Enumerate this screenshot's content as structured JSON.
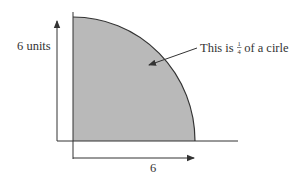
{
  "diagram": {
    "shape": "quarter-circle",
    "colors": {
      "fill": "#b9b9b9",
      "stroke": "#333333",
      "background": "#ffffff"
    },
    "vertical_label": "6 units",
    "horizontal_label": "6",
    "annotation": {
      "prefix": "This is ",
      "fraction_numerator": "1",
      "fraction_denominator": "4",
      "suffix": " of a cirle"
    }
  }
}
